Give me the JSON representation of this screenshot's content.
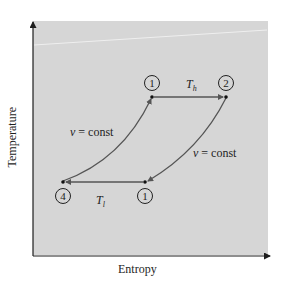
{
  "diagram": {
    "title": "",
    "type": "T-s diagram (thermodynamic cycle)",
    "axes": {
      "xlabel": "Entropy",
      "ylabel": "Temperature"
    },
    "states": [
      {
        "id": "top-left",
        "label": "1",
        "x": 152,
        "y": 97
      },
      {
        "id": "top-right",
        "label": "2",
        "x": 226,
        "y": 97
      },
      {
        "id": "bottom-right",
        "label": "1",
        "x": 145,
        "y": 182
      },
      {
        "id": "bottom-left",
        "label": "4",
        "x": 63,
        "y": 182
      }
    ],
    "processes": [
      {
        "from": "top-left",
        "to": "top-right",
        "kind": "isothermal",
        "label_var": "T",
        "label_sub": "h"
      },
      {
        "from": "top-right",
        "to": "bottom-right",
        "kind": "isochoric",
        "label_var": "v",
        "label_rest": " = const"
      },
      {
        "from": "bottom-right",
        "to": "bottom-left",
        "kind": "isothermal",
        "label_var": "T",
        "label_sub": "l"
      },
      {
        "from": "bottom-left",
        "to": "top-left",
        "kind": "isochoric",
        "label_var": "v",
        "label_rest": " = const"
      }
    ],
    "colors": {
      "plot_background": "#d6d6d6",
      "curve": "#555555",
      "axis": "#1e1e1e",
      "highlight_line": "#eeeeee"
    }
  }
}
